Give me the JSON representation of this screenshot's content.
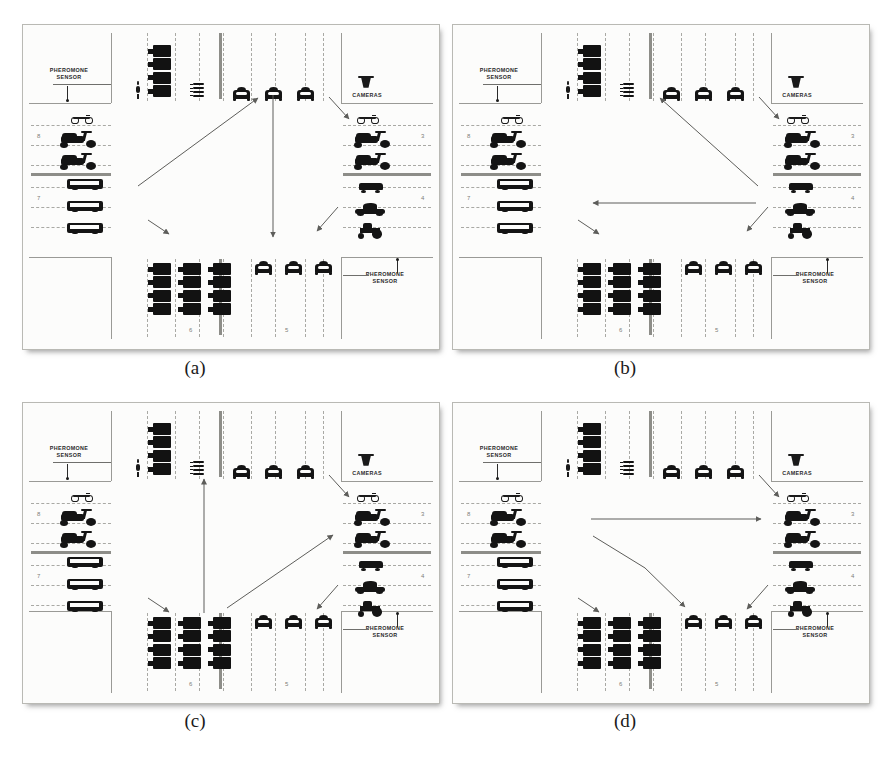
{
  "figure": {
    "background": "#ffffff",
    "width": 892,
    "height": 774,
    "panel_border_color": "#b9b9b4",
    "vehicle_color": "#141414"
  },
  "captions": [
    {
      "id": "a",
      "label": "(a)"
    },
    {
      "id": "b",
      "label": "(b)"
    },
    {
      "id": "c",
      "label": "(c)"
    },
    {
      "id": "d",
      "label": "(d)"
    }
  ],
  "labels": {
    "pheromone_sensor": "PHEROMONE\nSENSOR",
    "cameras": "CAMERAS"
  },
  "lane_numbers": {
    "top_left": "8",
    "bottom_left": "7",
    "top_right": "3",
    "bottom_right": "4",
    "bottom_mid_left": "6",
    "bottom_mid_right": "5"
  },
  "panels": [
    {
      "id": "a",
      "caption": "(a)",
      "sensors": [
        "top-left",
        "bottom-right"
      ],
      "cameras": [
        "top-right"
      ],
      "arrows": [
        {
          "name": "top-right-to-scooter",
          "from": [
            328,
            96
          ],
          "to": [
            348,
            118
          ],
          "style": "short"
        },
        {
          "name": "bus-to-northeast-car",
          "from": [
            137,
            185
          ],
          "to": [
            257,
            97
          ],
          "style": "long"
        },
        {
          "name": "north-south-center",
          "from": [
            272,
            94
          ],
          "to": [
            272,
            236
          ],
          "style": "long"
        },
        {
          "name": "bottom-left-bus-hook",
          "from": [
            147,
            219
          ],
          "to": [
            168,
            233
          ],
          "style": "short"
        },
        {
          "name": "tractor-to-bottom-car",
          "from": [
            337,
            206
          ],
          "to": [
            316,
            230
          ],
          "style": "short"
        }
      ]
    },
    {
      "id": "b",
      "caption": "(b)",
      "sensors": [
        "top-left",
        "bottom-right"
      ],
      "cameras": [
        "top-right"
      ],
      "arrows": [
        {
          "name": "top-right-to-scooter",
          "from": [
            758,
            96
          ],
          "to": [
            778,
            118
          ],
          "style": "short"
        },
        {
          "name": "lowcar-to-north-center",
          "from": [
            757,
            185
          ],
          "to": [
            659,
            97
          ],
          "style": "long"
        },
        {
          "name": "east-to-west-horizontal",
          "from": [
            755,
            202
          ],
          "to": [
            592,
            202
          ],
          "style": "long"
        },
        {
          "name": "bottom-left-bus-hook",
          "from": [
            577,
            219
          ],
          "to": [
            598,
            233
          ],
          "style": "short"
        },
        {
          "name": "tractor-to-bottom-car",
          "from": [
            767,
            206
          ],
          "to": [
            746,
            230
          ],
          "style": "short"
        }
      ]
    },
    {
      "id": "c",
      "caption": "(c)",
      "sensors": [
        "top-left",
        "bottom-right"
      ],
      "cameras": [
        "top-right"
      ],
      "arrows": [
        {
          "name": "top-right-to-scooter",
          "from": [
            328,
            474
          ],
          "to": [
            348,
            496
          ],
          "style": "short"
        },
        {
          "name": "south-to-north-center",
          "from": [
            203,
            612
          ],
          "to": [
            203,
            478
          ],
          "style": "long"
        },
        {
          "name": "southwest-to-scooter",
          "from": [
            226,
            607
          ],
          "to": [
            332,
            534
          ],
          "style": "long"
        },
        {
          "name": "bottom-left-bus-hook",
          "from": [
            147,
            597
          ],
          "to": [
            168,
            611
          ],
          "style": "short"
        },
        {
          "name": "tractor-to-bottom-car",
          "from": [
            337,
            584
          ],
          "to": [
            316,
            608
          ],
          "style": "short"
        }
      ]
    },
    {
      "id": "d",
      "caption": "(d)",
      "sensors": [
        "top-left",
        "bottom-right"
      ],
      "cameras": [
        "top-right"
      ],
      "arrows": [
        {
          "name": "top-right-to-scooter",
          "from": [
            758,
            474
          ],
          "to": [
            778,
            496
          ],
          "style": "short"
        },
        {
          "name": "west-to-east-horizontal",
          "from": [
            590,
            518
          ],
          "to": [
            760,
            518
          ],
          "style": "long"
        },
        {
          "name": "scooter-to-bottom-car",
          "from": [
            592,
            535
          ],
          "to": [
            684,
            606
          ],
          "style": "bend"
        },
        {
          "name": "bottom-left-bus-hook",
          "from": [
            577,
            597
          ],
          "to": [
            598,
            611
          ],
          "style": "short"
        },
        {
          "name": "tractor-to-bottom-car",
          "from": [
            767,
            584
          ],
          "to": [
            746,
            608
          ],
          "style": "short"
        }
      ]
    }
  ],
  "vehicle_legend": {
    "car": "car-front-icon",
    "scooter": "scooter-icon",
    "bicycle": "bicycle-icon",
    "bus": "bus-icon",
    "van": "van-icon",
    "tractor": "tractor-icon",
    "lowcar": "sports-car-icon",
    "pedestrian": "pedestrian-icon",
    "heavy_block": "queued-heavy-vehicle-icon",
    "camera": "camera-icon",
    "sensor": "pheromone-sensor-icon"
  }
}
